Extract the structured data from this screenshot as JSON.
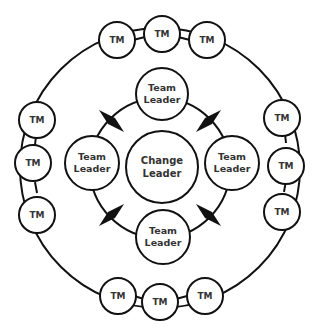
{
  "diagram": {
    "title": "",
    "colors": {
      "stroke": "#111111",
      "fill": "#ffffff",
      "text": "#333333"
    },
    "center": {
      "label_line1": "Change",
      "label_line2": "Leader"
    },
    "team_leaders": [
      {
        "position": "top",
        "label_line1": "Team",
        "label_line2": "Leader"
      },
      {
        "position": "left",
        "label_line1": "Team",
        "label_line2": "Leader"
      },
      {
        "position": "right",
        "label_line1": "Team",
        "label_line2": "Leader"
      },
      {
        "position": "bottom",
        "label_line1": "Team",
        "label_line2": "Leader"
      }
    ],
    "team_members": [
      {
        "group": "top",
        "label": "TM"
      },
      {
        "group": "top",
        "label": "TM"
      },
      {
        "group": "top",
        "label": "TM"
      },
      {
        "group": "left",
        "label": "TM"
      },
      {
        "group": "left",
        "label": "TM"
      },
      {
        "group": "left",
        "label": "TM"
      },
      {
        "group": "right",
        "label": "TM"
      },
      {
        "group": "right",
        "label": "TM"
      },
      {
        "group": "right",
        "label": "TM"
      },
      {
        "group": "bottom",
        "label": "TM"
      },
      {
        "group": "bottom",
        "label": "TM"
      },
      {
        "group": "bottom",
        "label": "TM"
      }
    ],
    "connectors": {
      "inner_ring": "diamond-arrows",
      "count": 4
    }
  }
}
